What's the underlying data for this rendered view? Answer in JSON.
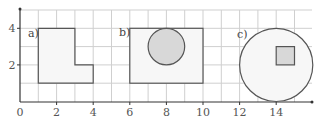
{
  "diagram": {
    "x_ticks": [
      {
        "value": 0,
        "label": "0"
      },
      {
        "value": 2,
        "label": "2"
      },
      {
        "value": 4,
        "label": "4"
      },
      {
        "value": 6,
        "label": "6"
      },
      {
        "value": 8,
        "label": "8"
      },
      {
        "value": 10,
        "label": "10"
      },
      {
        "value": 12,
        "label": "12"
      },
      {
        "value": 14,
        "label": "14"
      }
    ],
    "y_ticks": [
      {
        "value": 2,
        "label": "2"
      },
      {
        "value": 4,
        "label": "4"
      }
    ],
    "grid": {
      "x_min": 0,
      "x_max": 16,
      "y_min": 0,
      "y_max": 5
    },
    "shapes": [
      {
        "label": "a)",
        "type": "L-shape",
        "points": [
          [
            1,
            1
          ],
          [
            1,
            4
          ],
          [
            3,
            4
          ],
          [
            3,
            2
          ],
          [
            4,
            2
          ],
          [
            4,
            1
          ]
        ]
      },
      {
        "label": "b)",
        "type": "rectangle with inner circle",
        "rect": [
          6,
          1,
          10,
          4
        ],
        "circle": {
          "cx": 8,
          "cy": 3,
          "r": 1
        }
      },
      {
        "label": "c)",
        "type": "circle with inner square",
        "circle": {
          "cx": 14,
          "cy": 2,
          "r": 2
        },
        "square": [
          14,
          2,
          15,
          3
        ]
      }
    ],
    "colors": {
      "grid": "#c8c8c8",
      "outline": "#555555",
      "fill_light": "#f7f7f7",
      "fill_shaded": "#d8d8d8",
      "axis": "#333333"
    }
  }
}
